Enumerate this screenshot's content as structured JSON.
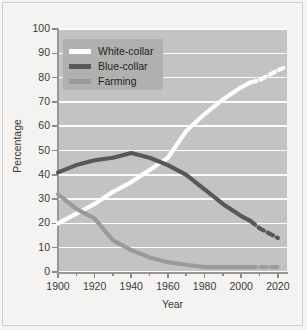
{
  "chart_data": {
    "type": "line",
    "title": "",
    "xlabel": "Year",
    "ylabel": "Percentage",
    "xlim": [
      1900,
      2025
    ],
    "ylim": [
      0,
      100
    ],
    "grid": true,
    "legend_position": "top-left-inset",
    "x_ticks": [
      1900,
      1920,
      1940,
      1960,
      1980,
      2000,
      2020
    ],
    "x_tick_labels": [
      "1900",
      "1920",
      "1940",
      "1960",
      "1980",
      "2000",
      "2020"
    ],
    "x_minor_ticks": [
      1910,
      1930,
      1950,
      1970,
      1990,
      2010
    ],
    "y_ticks": [
      0,
      10,
      20,
      30,
      40,
      50,
      60,
      70,
      80,
      90,
      100
    ],
    "y_tick_labels": [
      "0",
      "10",
      "20",
      "30",
      "40",
      "50",
      "60",
      "70",
      "80",
      "90",
      "100"
    ],
    "series": [
      {
        "name": "White-collar",
        "color": "#fdfdfb",
        "x": [
          1900,
          1910,
          1920,
          1930,
          1940,
          1950,
          1960,
          1970,
          1980,
          1990,
          2000,
          2005
        ],
        "values": [
          20,
          24,
          28,
          33,
          37,
          42,
          47,
          58,
          65,
          71,
          76,
          78
        ],
        "projection_x": [
          2005,
          2010,
          2015,
          2020,
          2023
        ],
        "projection_values": [
          78,
          79,
          81,
          83,
          84
        ],
        "projection_style": "dashed"
      },
      {
        "name": "Blue-collar",
        "color": "#58585a",
        "x": [
          1900,
          1910,
          1920,
          1930,
          1940,
          1950,
          1960,
          1970,
          1980,
          1990,
          2000,
          2005
        ],
        "values": [
          41,
          44,
          46,
          47,
          49,
          47,
          44,
          40,
          34,
          28,
          23,
          21
        ],
        "projection_x": [
          2005,
          2010,
          2015,
          2020
        ],
        "projection_values": [
          21,
          18,
          16,
          14
        ],
        "projection_style": "dashed"
      },
      {
        "name": "Farming",
        "color": "#9a9a98",
        "x": [
          1900,
          1910,
          1920,
          1930,
          1940,
          1950,
          1960,
          1970,
          1980,
          1990,
          2000,
          2005
        ],
        "values": [
          32,
          26,
          22,
          13,
          9,
          6,
          4,
          3,
          2,
          2,
          2,
          2
        ],
        "projection_x": [
          2005,
          2010,
          2015,
          2020
        ],
        "projection_values": [
          2,
          2,
          2,
          2
        ],
        "projection_style": "dashed"
      }
    ]
  },
  "axes": {
    "y_title": "Percentage",
    "x_title": "Year",
    "y_labels": [
      "100",
      "90",
      "80",
      "70",
      "60",
      "50",
      "40",
      "30",
      "20",
      "10",
      "0"
    ],
    "x_labels": [
      "1900",
      "1920",
      "1940",
      "1960",
      "1980",
      "2000",
      "2020"
    ]
  },
  "legend": {
    "items": [
      {
        "label": "White-collar",
        "color": "#fdfdfb"
      },
      {
        "label": "Blue-collar",
        "color": "#58585a"
      },
      {
        "label": "Farming",
        "color": "#9a9a98"
      }
    ]
  },
  "colors": {
    "plot_background": "#c3c3c1",
    "figure_background": "#f4f3f1",
    "gridline": "#fcfcfa",
    "axis": "#9a9896",
    "legend_background": "#b0b0ae",
    "text": "#3a3a38"
  }
}
